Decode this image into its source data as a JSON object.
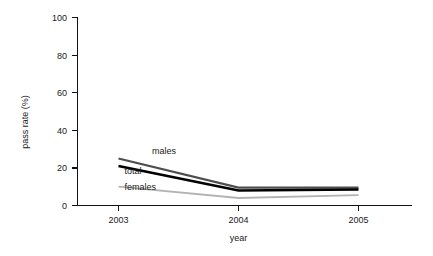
{
  "chart_data": {
    "type": "line",
    "title": "",
    "xlabel": "year",
    "ylabel": "pass rate (%)",
    "categories": [
      "2003",
      "2004",
      "2005"
    ],
    "x": [
      2003,
      2004,
      2005
    ],
    "xlim": [
      2003,
      2005
    ],
    "ylim": [
      0,
      100
    ],
    "yticks": [
      "0",
      "20",
      "40",
      "60",
      "80",
      "100"
    ],
    "ytick_values": [
      0,
      20,
      40,
      60,
      80,
      100
    ],
    "xticks": [
      "2003",
      "2004",
      "2005"
    ],
    "grid": false,
    "legend": "inline-labels",
    "series": [
      {
        "name": "males",
        "label": "males",
        "color": "#4d4d4d",
        "width": 2.2,
        "values": [
          25,
          9.5,
          9.5
        ]
      },
      {
        "name": "total",
        "label": "total",
        "color": "#000000",
        "width": 2.6,
        "values": [
          21,
          8,
          8.5
        ]
      },
      {
        "name": "females",
        "label": "females",
        "color": "#b3b3b3",
        "width": 1.8,
        "values": [
          10,
          4,
          5.5
        ]
      }
    ],
    "annotations": [
      {
        "text": "males",
        "series": "males",
        "x": 2003.28,
        "y": 27.5
      },
      {
        "text": "total",
        "series": "total",
        "x": 2003.05,
        "y": 16.5
      },
      {
        "text": "females",
        "series": "females",
        "x": 2003.05,
        "y": 8.5
      }
    ]
  },
  "axis": {
    "y_title": "pass rate (%)",
    "x_title": "year",
    "y_labels": [
      "100",
      "80",
      "60",
      "40",
      "20",
      "0"
    ],
    "x_labels": [
      "2003",
      "2004",
      "2005"
    ]
  }
}
